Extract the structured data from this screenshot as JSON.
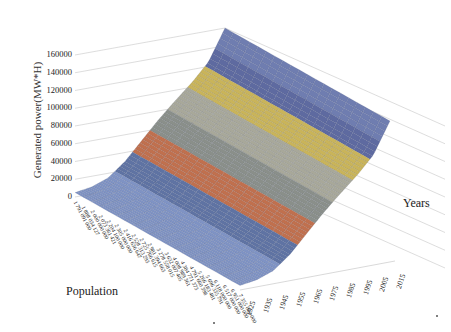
{
  "chart_data": {
    "type": "surface3d",
    "title": "",
    "zlabel": "Generated power(MW*H)",
    "xlabel": "Population",
    "ylabel": "Years",
    "z_ticks": [
      "0",
      "20000",
      "40000",
      "60000",
      "80000",
      "100000",
      "120000",
      "140000",
      "160000"
    ],
    "zlim": [
      0,
      160000
    ],
    "population_ticks": [
      "1 791 091 000",
      "1 888 034 127",
      "2 000 000 000",
      "2 073 361 421",
      "2 204 100 000",
      "2 305 000 000",
      "2 416 636 647",
      "2 528 313 293",
      "2 725 766 615",
      "2 981 394 663",
      "3 278 558 015",
      "3 632 007 405",
      "4 008 989 361",
      "4 384 771 373",
      "4 791 660 398",
      "5 266 183 481",
      "5 696 335 791",
      "6 118 000 000",
      "6 517 000 000",
      "6 951 000 000",
      "7 355 000 000"
    ],
    "year_ticks": [
      "1925",
      "1935",
      "1945",
      "1955",
      "1965",
      "1975",
      "1985",
      "1995",
      "2005",
      "2015"
    ],
    "band_step": 20000,
    "band_colors": [
      "#7f93c4",
      "#5f73a3",
      "#c0704e",
      "#8a8f8a",
      "#a8a89a",
      "#c9b45a",
      "#5e6aa0",
      "#6f7db0",
      "#78a05a",
      "#5a6288"
    ],
    "approx_generated_power_by_year": {
      "1925": 5000,
      "1935": 8000,
      "1945": 15000,
      "1955": 30000,
      "1965": 50000,
      "1975": 70000,
      "1985": 88000,
      "1995": 105000,
      "2005": 125000,
      "2015": 160000
    },
    "grid": true,
    "legend": "none"
  },
  "labels": {
    "z_title": "Generated power(MW*H)",
    "population_title": "Population",
    "years_title": "Years"
  }
}
